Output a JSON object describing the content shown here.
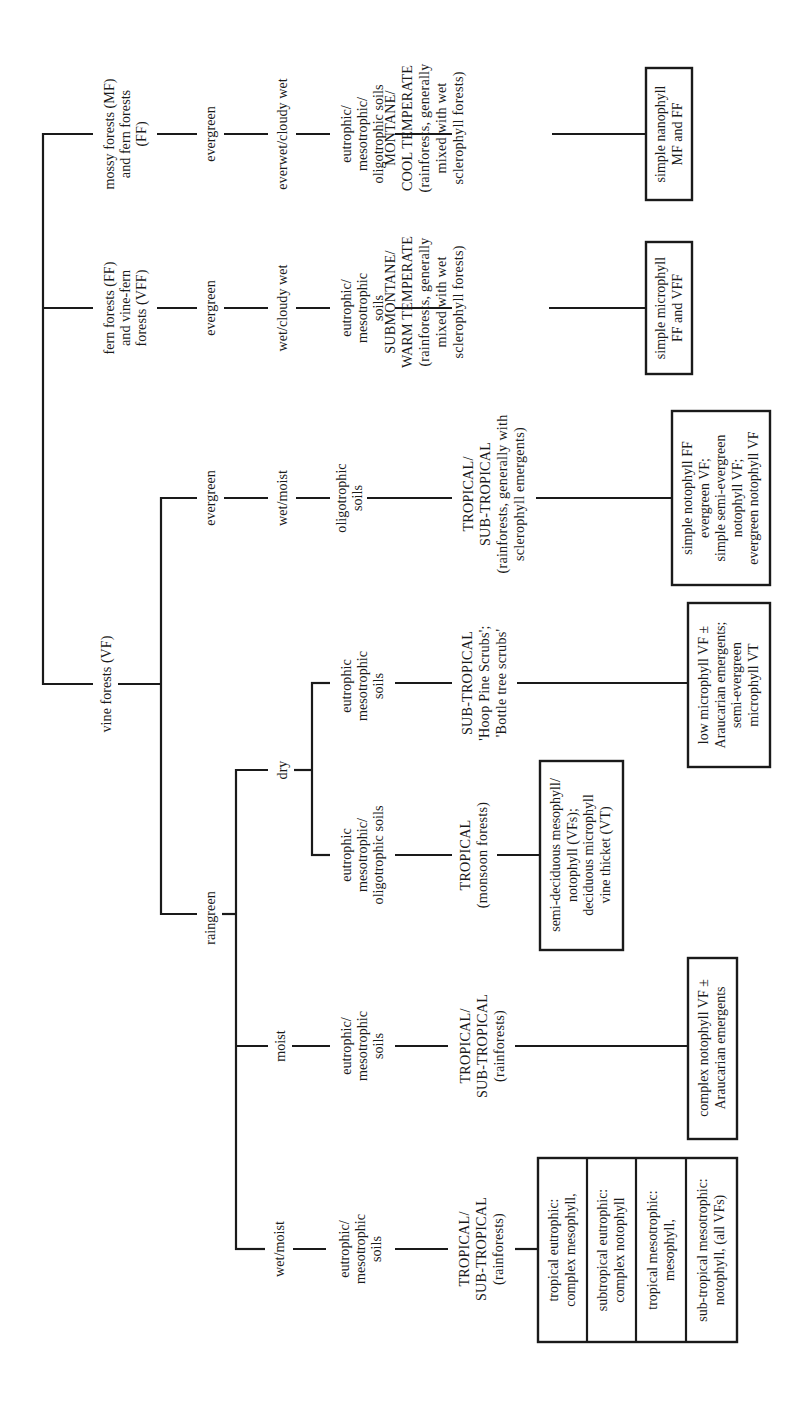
{
  "diagram": {
    "type": "classification-tree",
    "orientation": "rotated-90-ccw",
    "colors": {
      "line": "#1a1a1a",
      "background": "#ffffff"
    },
    "branches": {
      "mf": {
        "forest": "mossy forests (MF)\nand fern forests\n(FF)",
        "phenology": "evergreen",
        "moisture": "everwet/cloudy wet",
        "soils": "eutrophic/\nmesotrophic/\noligotrophic soils",
        "climate": "MONTANE/\nCOOL TEMPERATE\n(rainforests, generally\nmixed with wet\nsclerophyll forests)",
        "structural_type": "simple nanophyll\nMF and FF"
      },
      "ff": {
        "forest": "fern forests (FF)\nand vine-fern\nforests (VFF)",
        "phenology": "evergreen",
        "moisture": "wet/cloudy wet",
        "soils": "eutrophic/\nmesotrophic\nsoils",
        "climate": "SUBMONTANE/\nWARM TEMPERATE\n(rainforests, generally\nmixed with wet\nsclerophyll forests)",
        "structural_type": "simple microphyll\nFF and VFF"
      },
      "vf": {
        "forest": "vine forests (VF)",
        "evergreen": {
          "phenology": "evergreen",
          "moisture": "wet/moist",
          "soils": "oligotrophic\nsoils",
          "climate": "TROPICAL/\nSUB-TROPICAL\n(rainforests, generally with\nsclerophyll emergents)",
          "structural_type": "simple notophyll FF\nevergreen VF;\nsimple semi-evergreen\nnotophyll VF;\nevergreen notophyll VF"
        },
        "raingreen": {
          "phenology": "raingreen",
          "dry": {
            "moisture": "dry",
            "eutrophic": {
              "soils": "eutrophic\nmesotrophic\nsoils",
              "climate": "SUB-TROPICAL\n'Hoop Pine Scrubs';\n'Bottle tree scrubs'",
              "structural_type": "low microphyll VF ±\nAraucarian emergents;\nsemi-evergreen\nmicrophyll VT"
            },
            "oligotrophic": {
              "soils": "eutrophic\nmesotrophic/\noligotrophic soils",
              "climate": "TROPICAL\n(monsoon forests)",
              "structural_type": "semi-deciduous mesophyll/\nnotophyll (VFs);\ndeciduous microphyll\nvine thicket (VT)"
            }
          },
          "moist": {
            "moisture": "moist",
            "soils": "eutrophic/\nmesotrophic\nsoils",
            "climate": "TROPICAL/\nSUB-TROPICAL\n(rainforests)",
            "structural_type": "complex notophyll VF ±\nAraucarian emergents"
          },
          "wetmoist": {
            "moisture": "wet/moist",
            "soils": "eutrophic/\nmesotrophic\nsoils",
            "climate": "TROPICAL/\nSUB-TROPICAL\n(rainforests)",
            "structural_types": [
              "tropical eutrophic:\ncomplex mesophyll,",
              "subtropical eutrophic:\ncomplex notophyll",
              "tropical mesotrophic:\nmesophyll,",
              "sub-tropical mesotrophic:\nnotophyll, (all VFs)"
            ]
          }
        }
      }
    }
  }
}
